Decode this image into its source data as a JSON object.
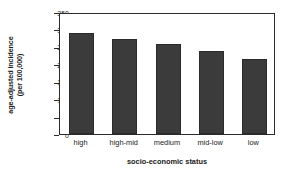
{
  "chart_data": {
    "type": "bar",
    "title": "",
    "xlabel": "socio-economic status",
    "ylabel_line1": "age-adjusted incidence",
    "ylabel_line2": "(per 100,000)",
    "categories": [
      "high",
      "high-mid",
      "medium",
      "mid-low",
      "low"
    ],
    "values": [
      291,
      273,
      258,
      237,
      214
    ],
    "ylim": [
      0,
      350
    ],
    "yticks": [
      0,
      50,
      100,
      150,
      200,
      250,
      300,
      350
    ],
    "ytick_labels": [
      "0",
      "50",
      "100",
      "150",
      "200",
      "250",
      "300",
      "350"
    ],
    "grid": false,
    "legend": "none",
    "bar_color": "#3b3b3b",
    "axis_color": "#2b2b2b",
    "background": "#ffffff"
  }
}
